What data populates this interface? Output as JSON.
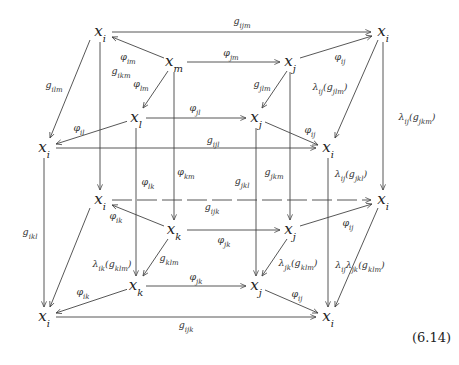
{
  "equation_number": "(6.14)",
  "nodes": [
    {
      "id": "n_i_tl",
      "label": "x_i",
      "x": 100,
      "y": 32
    },
    {
      "id": "n_i_tr",
      "label": "x_i",
      "x": 383,
      "y": 32
    },
    {
      "id": "n_m",
      "label": "x_m",
      "x": 174,
      "y": 62
    },
    {
      "id": "n_j_t1",
      "label": "x_j",
      "x": 290,
      "y": 62
    },
    {
      "id": "n_l",
      "label": "x_l",
      "x": 136,
      "y": 118
    },
    {
      "id": "n_j_t2",
      "label": "x_j",
      "x": 256,
      "y": 118
    },
    {
      "id": "n_i_ml",
      "label": "x_i",
      "x": 44,
      "y": 148
    },
    {
      "id": "n_i_mr",
      "label": "x_i",
      "x": 328,
      "y": 148
    },
    {
      "id": "n_i_bl1",
      "label": "x_i",
      "x": 100,
      "y": 200
    },
    {
      "id": "n_i_br1",
      "label": "x_i",
      "x": 383,
      "y": 200
    },
    {
      "id": "n_k1",
      "label": "x_k",
      "x": 174,
      "y": 230
    },
    {
      "id": "n_j_b1",
      "label": "x_j",
      "x": 290,
      "y": 230
    },
    {
      "id": "n_k2",
      "label": "x_k",
      "x": 136,
      "y": 286
    },
    {
      "id": "n_j_b2",
      "label": "x_j",
      "x": 256,
      "y": 286
    },
    {
      "id": "n_i_bl2",
      "label": "x_i",
      "x": 44,
      "y": 317
    },
    {
      "id": "n_i_br2",
      "label": "x_i",
      "x": 328,
      "y": 317
    }
  ],
  "edges": [
    {
      "label": "g_ijm",
      "x1": 112,
      "y1": 32,
      "x2": 371,
      "y2": 32,
      "lx": 242,
      "ly": 24,
      "dashed": false
    },
    {
      "label": "φ_im",
      "x1": 164,
      "y1": 58,
      "x2": 112,
      "y2": 37,
      "lx": 128,
      "ly": 60,
      "dashed": false
    },
    {
      "label": "φ_jm",
      "x1": 187,
      "y1": 62,
      "x2": 280,
      "y2": 62,
      "lx": 231,
      "ly": 56,
      "dashed": false
    },
    {
      "label": "φ_ij",
      "x1": 300,
      "y1": 58,
      "x2": 372,
      "y2": 36,
      "lx": 340,
      "ly": 60,
      "dashed": false
    },
    {
      "label": "φ_lm",
      "x1": 168,
      "y1": 71,
      "x2": 143,
      "y2": 108,
      "lx": 141,
      "ly": 87,
      "dashed": false
    },
    {
      "label": "g_jlm",
      "x1": 287,
      "y1": 71,
      "x2": 262,
      "y2": 108,
      "lx": 262,
      "ly": 87,
      "dashed": false
    },
    {
      "label": "g_ilm",
      "x1": 90,
      "y1": 40,
      "x2": 50,
      "y2": 138,
      "lx": 54,
      "ly": 88,
      "dashed": false
    },
    {
      "label": "λ_ij(g_jlm)",
      "x1": 378,
      "y1": 40,
      "x2": 335,
      "y2": 138,
      "lx": 330,
      "ly": 90,
      "dashed": false
    },
    {
      "label": "λ_ij(g_jkm)",
      "x1": 383,
      "y1": 42,
      "x2": 383,
      "y2": 190,
      "lx": 417,
      "ly": 120,
      "dashed": false
    },
    {
      "label": "φ_jl",
      "x1": 146,
      "y1": 118,
      "x2": 246,
      "y2": 118,
      "lx": 195,
      "ly": 111,
      "dashed": false
    },
    {
      "label": "φ_il",
      "x1": 128,
      "y1": 121,
      "x2": 56,
      "y2": 144,
      "lx": 79,
      "ly": 131,
      "dashed": false
    },
    {
      "label": "φ_ij",
      "x1": 265,
      "y1": 122,
      "x2": 318,
      "y2": 145,
      "lx": 310,
      "ly": 133,
      "dashed": false
    },
    {
      "label": "g_ijl",
      "x1": 56,
      "y1": 148,
      "x2": 316,
      "y2": 148,
      "lx": 213,
      "ly": 143,
      "dashed": false
    },
    {
      "label": "g_ikm",
      "x1": 100,
      "y1": 42,
      "x2": 100,
      "y2": 190,
      "lx": 121,
      "ly": 74,
      "dashed": false
    },
    {
      "label": "φ_lk",
      "x1": 136,
      "y1": 128,
      "x2": 136,
      "y2": 276,
      "lx": 148,
      "ly": 185,
      "dashed": false
    },
    {
      "label": "φ_km",
      "x1": 174,
      "y1": 72,
      "x2": 174,
      "y2": 220,
      "lx": 186,
      "ly": 175,
      "dashed": false
    },
    {
      "label": "g_jkl",
      "x1": 256,
      "y1": 128,
      "x2": 256,
      "y2": 276,
      "lx": 242,
      "ly": 184,
      "dashed": false
    },
    {
      "label": "g_jkm",
      "x1": 290,
      "y1": 72,
      "x2": 290,
      "y2": 220,
      "lx": 274,
      "ly": 175,
      "dashed": false
    },
    {
      "label": "λ_ij(g_jkl)",
      "x1": 328,
      "y1": 158,
      "x2": 328,
      "y2": 307,
      "lx": 351,
      "ly": 177,
      "dashed": false
    },
    {
      "label": "g_ikl",
      "x1": 44,
      "y1": 158,
      "x2": 44,
      "y2": 307,
      "lx": 30,
      "ly": 235,
      "dashed": false
    },
    {
      "label": "g_ijk",
      "x1": 112,
      "y1": 200,
      "x2": 371,
      "y2": 200,
      "lx": 212,
      "ly": 210,
      "dashed": true
    },
    {
      "label": "φ_ik",
      "x1": 164,
      "y1": 226,
      "x2": 112,
      "y2": 205,
      "lx": 116,
      "ly": 219,
      "dashed": false
    },
    {
      "label": "φ_jk",
      "x1": 187,
      "y1": 230,
      "x2": 280,
      "y2": 230,
      "lx": 224,
      "ly": 243,
      "dashed": false
    },
    {
      "label": "φ_ij",
      "x1": 300,
      "y1": 226,
      "x2": 372,
      "y2": 204,
      "lx": 348,
      "ly": 226,
      "dashed": false
    },
    {
      "label": "g_klm",
      "x1": 168,
      "y1": 239,
      "x2": 143,
      "y2": 276,
      "lx": 169,
      "ly": 261,
      "dashed": false
    },
    {
      "label": "λ_jk(g_klm)",
      "x1": 287,
      "y1": 239,
      "x2": 262,
      "y2": 276,
      "lx": 298,
      "ly": 266,
      "dashed": false
    },
    {
      "label": "λ_ik(g_klm)",
      "x1": 90,
      "y1": 208,
      "x2": 50,
      "y2": 307,
      "lx": 112,
      "ly": 267,
      "dashed": false
    },
    {
      "label": "λ_ijλ_jk(g_klm)",
      "x1": 378,
      "y1": 208,
      "x2": 335,
      "y2": 307,
      "lx": 360,
      "ly": 268,
      "dashed": false
    },
    {
      "label": "φ_jk",
      "x1": 146,
      "y1": 286,
      "x2": 246,
      "y2": 286,
      "lx": 196,
      "ly": 280,
      "dashed": false
    },
    {
      "label": "φ_ik",
      "x1": 128,
      "y1": 289,
      "x2": 56,
      "y2": 313,
      "lx": 83,
      "ly": 295,
      "dashed": false
    },
    {
      "label": "φ_ij",
      "x1": 265,
      "y1": 290,
      "x2": 318,
      "y2": 313,
      "lx": 297,
      "ly": 297,
      "dashed": false
    },
    {
      "label": "g_ijk",
      "x1": 56,
      "y1": 317,
      "x2": 316,
      "y2": 317,
      "lx": 186,
      "ly": 328,
      "dashed": false
    }
  ]
}
